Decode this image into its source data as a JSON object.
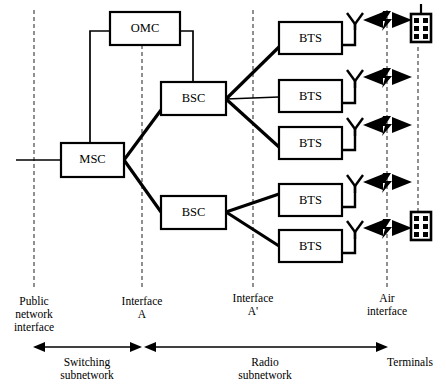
{
  "diagram": {
    "colors": {
      "stroke": "#000000",
      "background": "#ffffff",
      "guide": "#555555"
    },
    "nodes": {
      "omc": {
        "label": "OMC",
        "x": 110,
        "y": 12,
        "w": 70,
        "h": 33
      },
      "msc": {
        "label": "MSC",
        "x": 61,
        "y": 143,
        "w": 63,
        "h": 34
      },
      "bsc_upper": {
        "label": "BSC",
        "x": 161,
        "y": 82,
        "w": 65,
        "h": 33
      },
      "bsc_lower": {
        "label": "BSC",
        "x": 161,
        "y": 196,
        "w": 65,
        "h": 33
      },
      "bts_1": {
        "label": "BTS",
        "x": 279,
        "y": 22,
        "w": 63,
        "h": 32
      },
      "bts_2": {
        "label": "BTS",
        "x": 279,
        "y": 80,
        "w": 63,
        "h": 32
      },
      "bts_3": {
        "label": "BTS",
        "x": 279,
        "y": 127,
        "w": 63,
        "h": 32
      },
      "bts_4": {
        "label": "BTS",
        "x": 279,
        "y": 184,
        "w": 63,
        "h": 32
      },
      "bts_5": {
        "label": "BTS",
        "x": 279,
        "y": 230,
        "w": 63,
        "h": 32
      }
    },
    "interfaces": [
      {
        "name": "public-network-interface",
        "x": 34,
        "line_top": 10,
        "line_bottom": 290,
        "label_lines": [
          "Public",
          "network",
          "interface"
        ],
        "label_x": 34,
        "label_y": 305
      },
      {
        "name": "interface-a",
        "x": 142,
        "line_top": 45,
        "line_bottom": 290,
        "label_lines": [
          "Interface",
          "A"
        ],
        "label_x": 142,
        "label_y": 305
      },
      {
        "name": "interface-a-prime",
        "x": 253,
        "line_top": 10,
        "line_bottom": 290,
        "label_lines": [
          "Interface",
          "A'"
        ],
        "label_x": 253,
        "label_y": 305
      },
      {
        "name": "air-interface",
        "x": 387,
        "line_top": 10,
        "line_bottom": 290,
        "label_lines": [
          "Air",
          "interface"
        ],
        "label_x": 387,
        "label_y": 305
      }
    ],
    "antennas": [
      {
        "name": "antenna-1",
        "x": 355,
        "y": 13
      },
      {
        "name": "antenna-2",
        "x": 355,
        "y": 70
      },
      {
        "name": "antenna-3",
        "x": 355,
        "y": 118
      },
      {
        "name": "antenna-4",
        "x": 355,
        "y": 175
      },
      {
        "name": "antenna-5",
        "x": 355,
        "y": 221
      }
    ],
    "air_links": [
      {
        "name": "air-link-1",
        "y": 20
      },
      {
        "name": "air-link-2",
        "y": 77
      },
      {
        "name": "air-link-3",
        "y": 125
      },
      {
        "name": "air-link-4",
        "y": 182
      },
      {
        "name": "air-link-5",
        "y": 228
      }
    ],
    "terminals": [
      {
        "name": "terminal-upper",
        "x": 418,
        "y": 18
      },
      {
        "name": "terminal-lower",
        "x": 418,
        "y": 214
      }
    ],
    "scale": {
      "y": 347,
      "segments": [
        {
          "name": "switching-subnetwork",
          "label_lines": [
            "Switching",
            "subnetwork"
          ],
          "x_start": 34,
          "x_end": 140,
          "label_x": 87,
          "label_y": 366
        },
        {
          "name": "radio-subnetwork",
          "label_lines": [
            "Radio",
            "subnetwork"
          ],
          "x_start": 144,
          "x_end": 387,
          "label_x": 265,
          "label_y": 366
        },
        {
          "name": "terminals",
          "label_lines": [
            "Terminals"
          ],
          "x_start": 387,
          "x_end": 387,
          "label_x": 405,
          "label_y": 366
        }
      ]
    },
    "external_link": {
      "name": "public-network-link",
      "x_start": 16,
      "x_end": 61,
      "y": 160
    }
  }
}
